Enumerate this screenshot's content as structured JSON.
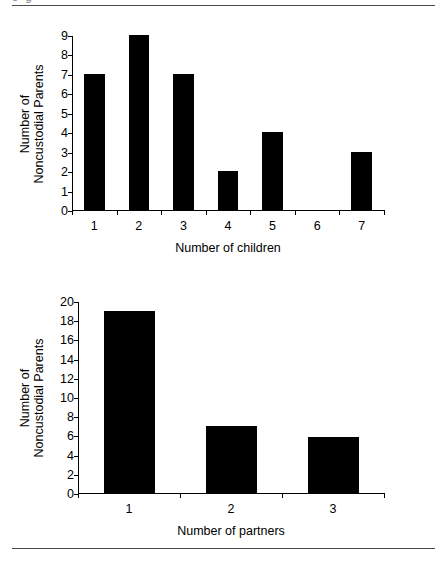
{
  "figure": {
    "clipped_caption_fragment": "o                    g",
    "rule_color": "#4a4a4a",
    "bar_color": "#000000",
    "axis_color": "#000000",
    "background": "#ffffff"
  },
  "chart_data": [
    {
      "type": "bar",
      "title": "",
      "xlabel": "Number of children",
      "ylabel": "Number of Noncustodial Parents",
      "ylabel_line1": "Number of",
      "ylabel_line2": "Noncustodial Parents",
      "categories": [
        "1",
        "2",
        "3",
        "4",
        "5",
        "6",
        "7"
      ],
      "values": [
        7,
        9,
        7,
        2,
        4,
        0,
        3
      ],
      "yticks": [
        0,
        1,
        2,
        3,
        4,
        5,
        6,
        7,
        8,
        9
      ],
      "ylim": [
        0,
        9
      ],
      "grid": false,
      "legend": false
    },
    {
      "type": "bar",
      "title": "",
      "xlabel": "Number of partners",
      "ylabel": "Number of Noncustodial Parents",
      "ylabel_line1": "Number of",
      "ylabel_line2": "Noncustodial Parents",
      "categories": [
        "1",
        "2",
        "3"
      ],
      "values": [
        19,
        7,
        5.8
      ],
      "yticks": [
        0,
        2,
        4,
        6,
        8,
        10,
        12,
        14,
        16,
        18,
        20
      ],
      "ylim": [
        0,
        20
      ],
      "grid": false,
      "legend": false
    }
  ]
}
